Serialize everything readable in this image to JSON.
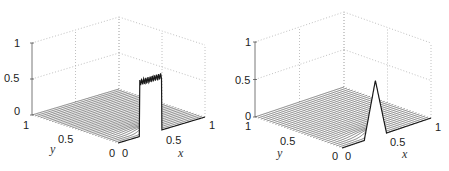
{
  "chart_data": [
    {
      "type": "surface3d",
      "panel": "left",
      "title": "",
      "xlabel": "x",
      "ylabel": "y",
      "zlabel": "",
      "xlim": [
        0,
        1
      ],
      "ylim": [
        0,
        1
      ],
      "zlim": [
        0,
        1
      ],
      "xticks": [
        "0",
        "0.5",
        "1"
      ],
      "yticks": [
        "0",
        "0.5",
        "1"
      ],
      "zticks": [
        "0",
        "0.5",
        "1"
      ],
      "grid": true,
      "description": "Mesh of profiles along x for many y-slices; square pulse of height ~0.75 on x in [0.25, 0.5] at y=0 with Gibbs-like oscillations at edges; decays to 0 with increasing y",
      "pulse": {
        "x_start": 0.25,
        "x_end": 0.5,
        "height": 0.75,
        "oscillation_amplitude": 0.04
      },
      "n_slices": 30
    },
    {
      "type": "surface3d",
      "panel": "right",
      "title": "",
      "xlabel": "x",
      "ylabel": "y",
      "zlabel": "",
      "xlim": [
        0,
        1
      ],
      "ylim": [
        0,
        1
      ],
      "zlim": [
        0,
        1
      ],
      "xticks": [
        "0",
        "0.5",
        "1"
      ],
      "yticks": [
        "0",
        "0.5",
        "1"
      ],
      "zticks": [
        "0",
        "0.5",
        "1"
      ],
      "grid": true,
      "description": "Mesh of profiles along x for many y-slices; triangular (hat) pulse peaking at ~0.75 at x~0.375 on y=0, support [0.25, 0.5]; decays to 0 with increasing y",
      "pulse": {
        "x_start": 0.25,
        "x_peak": 0.375,
        "x_end": 0.5,
        "height": 0.75
      },
      "n_slices": 30
    }
  ],
  "panels": {
    "left": {
      "origin": [
        118,
        143
      ],
      "ex": [
        87,
        -26
      ],
      "ey": [
        -86,
        -28
      ],
      "ez": [
        0,
        -72
      ],
      "labels": {
        "z1": "1",
        "z05": "0.5",
        "z0": "0",
        "y1": "1",
        "y05": "0.5",
        "y0": "0",
        "x0": "0",
        "x05": "0.5",
        "x1": "1",
        "xname": "x",
        "yname": "y"
      }
    },
    "right": {
      "origin": [
        342,
        148
      ],
      "ex": [
        89,
        -30
      ],
      "ey": [
        -87,
        -31
      ],
      "ez": [
        0,
        -75
      ],
      "labels": {
        "z1": "1",
        "z05": "0.5",
        "z0": "0",
        "y1": "1",
        "y05": "0.5",
        "y0": "0",
        "x0": "0",
        "x05": "0.5",
        "x1": "1",
        "xname": "x",
        "yname": "y"
      }
    }
  },
  "colors": {
    "line": "#1a1a1a",
    "grid": "#b0b0b0",
    "axis": "#555555"
  }
}
